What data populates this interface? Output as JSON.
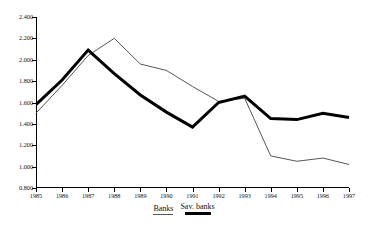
{
  "chart_data": {
    "type": "line",
    "title": "",
    "subtitle": "",
    "xlabel": "",
    "ylabel": "",
    "grid": false,
    "legend_position": "bottom",
    "categories": [
      "1985",
      "1986",
      "1987",
      "1988",
      "1989",
      "1990",
      "1991",
      "1992",
      "1993",
      "1994",
      "1995",
      "1996",
      "1997"
    ],
    "x": [
      1985,
      1986,
      1987,
      1988,
      1989,
      1990,
      1991,
      1992,
      1993,
      1994,
      1995,
      1996,
      1997
    ],
    "xlim": [
      1985,
      1997
    ],
    "ylim": [
      0.8,
      2.4
    ],
    "ytick_labels": [
      "2.400",
      "2.200",
      "2.000",
      "1.800",
      "1.600",
      "1.400",
      "1.200",
      "1.000",
      "0.800"
    ],
    "yticks": [
      2.4,
      2.2,
      2.0,
      1.8,
      1.6,
      1.4,
      1.2,
      1.0,
      0.8
    ],
    "xtick_labels": [
      "1985",
      "1986",
      "1987",
      "1988",
      "1989",
      "1990",
      "1991",
      "1992",
      "1993",
      "1994",
      "1995",
      "1996",
      "1997"
    ],
    "series": [
      {
        "name": "Banks",
        "style": "thin",
        "color": "#555555",
        "values": [
          1.5,
          1.76,
          2.04,
          2.2,
          1.96,
          1.9,
          1.75,
          1.61,
          1.64,
          1.1,
          1.05,
          1.08,
          1.02
        ]
      },
      {
        "name": "Sav. banks",
        "style": "thick",
        "color": "#000000",
        "values": [
          1.58,
          1.81,
          2.09,
          1.87,
          1.67,
          1.51,
          1.37,
          1.6,
          1.66,
          1.45,
          1.44,
          1.5,
          1.46
        ]
      }
    ]
  },
  "legend": {
    "entries": [
      {
        "label": "Banks",
        "swatch": "thin-line-swatch"
      },
      {
        "label": "Sav. banks",
        "swatch": "thick-line-swatch"
      }
    ]
  }
}
